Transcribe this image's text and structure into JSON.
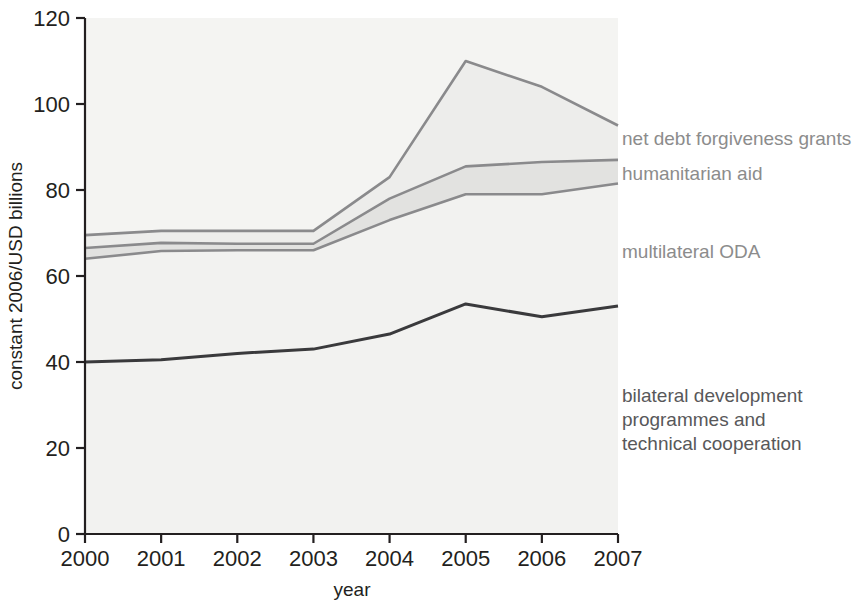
{
  "chart_data": {
    "type": "area",
    "title": "",
    "subtitle": "",
    "xlabel": "year",
    "ylabel": "constant 2006/USD billions",
    "categories": [
      "2000",
      "2001",
      "2002",
      "2003",
      "2004",
      "2005",
      "2006",
      "2007"
    ],
    "x": [
      2000,
      2001,
      2002,
      2003,
      2004,
      2005,
      2006,
      2007
    ],
    "xlim": [
      2000,
      2007
    ],
    "ylim": [
      0,
      120
    ],
    "ytick_labels": [
      "0",
      "20",
      "40",
      "60",
      "80",
      "100",
      "120"
    ],
    "yticks": [
      0,
      20,
      40,
      60,
      80,
      100,
      120
    ],
    "xtick_labels": [
      "2000",
      "2001",
      "2002",
      "2003",
      "2004",
      "2005",
      "2006",
      "2007"
    ],
    "grid": false,
    "legend_position": "right-inline-annotations",
    "stacked": true,
    "series": [
      {
        "name": "bilateral development programmes and technical cooperation",
        "values": [
          40,
          40.5,
          42,
          43,
          46.5,
          53.5,
          50.5,
          53
        ],
        "cumulative": [
          40,
          40.5,
          42,
          43,
          46.5,
          53.5,
          50.5,
          53
        ],
        "fill": "#f2f2f0",
        "stroke": "#3a3a3c"
      },
      {
        "name": "multilateral ODA",
        "values": [
          24,
          25.3,
          24,
          23,
          26.5,
          25.5,
          28.5,
          28.5
        ],
        "cumulative": [
          64,
          65.8,
          66,
          66,
          73,
          79,
          79,
          81.5
        ],
        "fill": "#f2f2f0",
        "stroke": "#8a8a8c"
      },
      {
        "name": "humanitarian aid",
        "values": [
          2.5,
          1.9,
          1.5,
          1.5,
          5,
          6.5,
          7.5,
          5.5
        ],
        "cumulative": [
          66.5,
          67.7,
          67.5,
          67.5,
          78,
          85.5,
          86.5,
          87
        ],
        "fill": "#e2e2e0",
        "stroke": "#8a8a8c"
      },
      {
        "name": "net debt forgiveness grants",
        "values": [
          3,
          2.8,
          3,
          3,
          5,
          24.5,
          17.5,
          8
        ],
        "cumulative": [
          69.5,
          70.5,
          70.5,
          70.5,
          83,
          110,
          104,
          95
        ],
        "fill": "#ededeb",
        "stroke": "#8a8a8c"
      }
    ],
    "annotations": [
      {
        "id": "net-debt-forgiveness-grants",
        "text": "net debt forgiveness grants",
        "x": 618,
        "y": 139
      },
      {
        "id": "humanitarian-aid",
        "text": "humanitarian aid",
        "x": 618,
        "y": 174
      },
      {
        "id": "multilateral-oda",
        "text": "multilateral ODA",
        "x": 618,
        "y": 252
      },
      {
        "id": "bilateral-development",
        "line1": "bilateral development",
        "line2": "programmes and",
        "line3": "technical cooperation",
        "x": 618,
        "y": 396
      }
    ],
    "colors": {
      "axis": "#231f20",
      "plot_background": "#f4f4f2",
      "band_light": "#f2f2f0",
      "band_mid": "#e6e6e4",
      "line_dark": "#3a3a3c",
      "line_gray": "#8a8a8c",
      "label_gray": "#8c8c8c",
      "label_dark": "#58585a"
    }
  },
  "axes": {
    "y_title": "constant 2006/USD billions",
    "x_title": "year",
    "y_ticks": [
      "120",
      "100",
      "80",
      "60",
      "40",
      "20",
      "0"
    ],
    "x_ticks": [
      "2000",
      "2001",
      "2002",
      "2003",
      "2004",
      "2005",
      "2006",
      "2007"
    ]
  },
  "labels": {
    "net_debt": "net debt forgiveness grants",
    "humanitarian": "humanitarian aid",
    "multilateral": "multilateral ODA",
    "bilateral_l1": "bilateral development",
    "bilateral_l2": "programmes and",
    "bilateral_l3": "technical cooperation"
  }
}
